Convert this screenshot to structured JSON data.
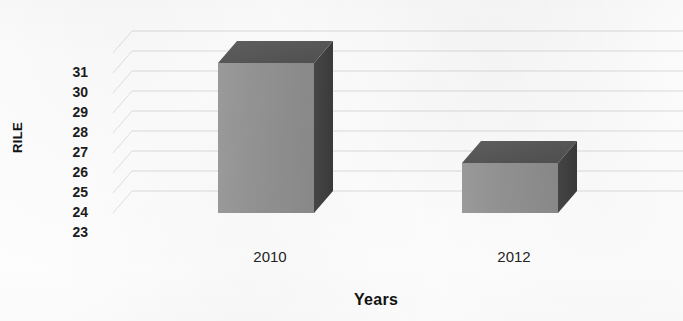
{
  "chart_data": {
    "type": "bar",
    "title": "",
    "subtitle": "",
    "xlabel": "Years",
    "ylabel": "RILE",
    "categories": [
      "2010",
      "2012"
    ],
    "values": [
      30.5,
      25.5
    ],
    "series": [
      {
        "name": "RILE",
        "values": [
          30.5,
          25.5
        ]
      }
    ],
    "ylim": [
      23,
      31
    ],
    "y_ticks": [
      "31",
      "30",
      "29",
      "28",
      "27",
      "26",
      "25",
      "24",
      "23"
    ],
    "y_tick_values": [
      31,
      30,
      29,
      28,
      27,
      26,
      25,
      24,
      23
    ],
    "grid": true,
    "grid_orientation": "horizontal",
    "legend": "none",
    "style": "3d-column",
    "colors": {
      "bar_front": "#919191",
      "bar_top": "#5a5a5a",
      "bar_side": "#3f3f3f",
      "gridline": "#c9c9c9",
      "background": "#fdfdfd",
      "text": "#1c1c1c"
    }
  },
  "axes": {
    "y_title": "RILE",
    "x_title": "Years"
  }
}
